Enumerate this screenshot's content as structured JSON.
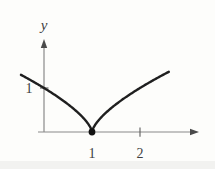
{
  "figure": {
    "background": "#fdfdfb",
    "axis_color": "#8a8a8a",
    "curve_color": "#1f1f1f",
    "label_color": "#3f3f3f",
    "y_axis_label": "y"
  },
  "chart_data": {
    "type": "line",
    "title": "",
    "function": "y = |x - 1|^(2/3)",
    "cusp_center": 1,
    "exponent": 0.6667,
    "domain": [
      -0.48,
      2.6
    ],
    "cusp_point": {
      "x": 1,
      "y": 0,
      "marker": "filled-dot"
    },
    "y_intercept": {
      "x": 0,
      "y": 1
    },
    "x_ticks": [
      1,
      2
    ],
    "y_ticks": [
      1
    ],
    "xlabel": "",
    "ylabel": "y",
    "xlim": [
      -0.6,
      3.2
    ],
    "ylim": [
      0,
      2.1
    ],
    "grid": false,
    "legend": null
  }
}
